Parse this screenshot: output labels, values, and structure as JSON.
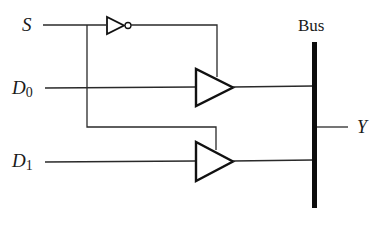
{
  "diagram": {
    "type": "tri-state bus multiplexer",
    "labels": {
      "select": "S",
      "d0_letter": "D",
      "d0_sub": "0",
      "d1_letter": "D",
      "d1_sub": "1",
      "bus": "Bus",
      "output": "Y"
    },
    "components": [
      {
        "id": "inverter",
        "kind": "NOT gate",
        "input": "S"
      },
      {
        "id": "buffer0",
        "kind": "tri-state buffer",
        "input": "D0",
        "enable": "S'"
      },
      {
        "id": "buffer1",
        "kind": "tri-state buffer",
        "input": "D1",
        "enable": "S"
      },
      {
        "id": "bus",
        "kind": "bus line"
      }
    ],
    "colors": {
      "line": "#2a2a2a",
      "gate": "#111111",
      "background": "#ffffff"
    }
  }
}
